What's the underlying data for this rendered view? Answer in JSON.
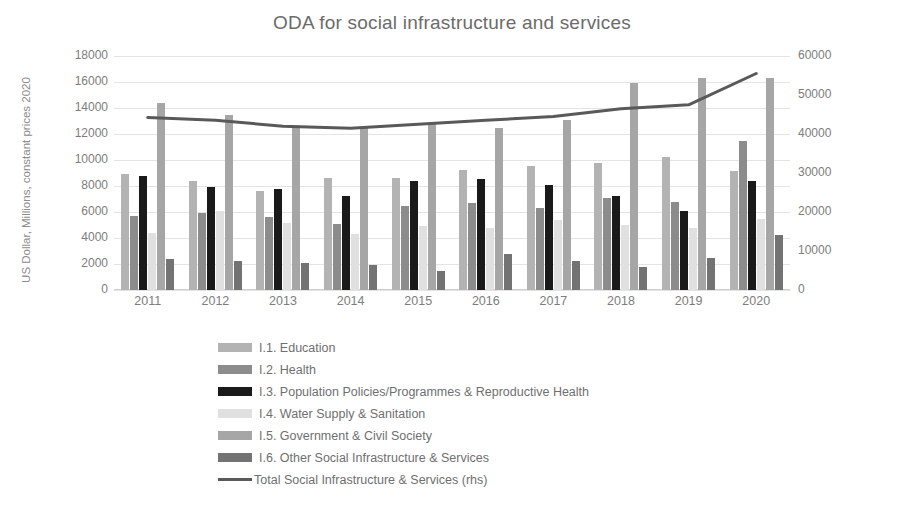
{
  "chart_data": {
    "type": "bar",
    "title": "ODA for social infrastructure and services",
    "xlabel": "",
    "ylabel": "US Dollar, Millions, constant prices 2020",
    "ylabel_right": "",
    "categories": [
      "2011",
      "2012",
      "2013",
      "2014",
      "2015",
      "2016",
      "2017",
      "2018",
      "2019",
      "2020"
    ],
    "ylim": [
      0,
      18000
    ],
    "yticks": [
      "0",
      "2000",
      "4000",
      "6000",
      "8000",
      "10000",
      "12000",
      "14000",
      "16000",
      "18000"
    ],
    "ylim_right": [
      0,
      60000
    ],
    "yticks_right": [
      "0",
      "10000",
      "20000",
      "30000",
      "40000",
      "50000",
      "60000"
    ],
    "grid": true,
    "legend_position": "bottom",
    "series": [
      {
        "name": "I.1. Education",
        "color": "#b3b3b3",
        "axis": "left",
        "values": [
          8900,
          8350,
          7650,
          8650,
          8600,
          9200,
          9550,
          9750,
          10250,
          9150
        ]
      },
      {
        "name": "I.2. Health",
        "color": "#8c8c8c",
        "axis": "left",
        "values": [
          5700,
          5950,
          5650,
          5100,
          6500,
          6700,
          6300,
          7100,
          6750,
          11500
        ]
      },
      {
        "name": "I.3. Population Policies/Programmes & Reproductive Health",
        "color": "#1a1a1a",
        "axis": "left",
        "values": [
          8750,
          7900,
          7800,
          7250,
          8350,
          8550,
          8100,
          7200,
          6050,
          8350
        ]
      },
      {
        "name": "I.4. Water Supply & Sanitation",
        "color": "#e0e0e0",
        "axis": "left",
        "values": [
          4350,
          6050,
          5150,
          4300,
          4900,
          4800,
          5400,
          5000,
          4750,
          5450
        ]
      },
      {
        "name": "I.5. Government & Civil Society",
        "color": "#a6a6a6",
        "axis": "left",
        "values": [
          14350,
          13500,
          12550,
          12500,
          12800,
          12500,
          13100,
          15950,
          16300,
          16300
        ]
      },
      {
        "name": "I.6. Other Social Infrastructure & Services",
        "color": "#737373",
        "axis": "left",
        "values": [
          2400,
          2200,
          2050,
          1900,
          1500,
          2750,
          2250,
          1800,
          2450,
          4200
        ]
      }
    ],
    "line_series": {
      "name": "Total Social Infrastructure & Services (rhs)",
      "color": "#595959",
      "axis": "right",
      "values": [
        44200,
        43500,
        42000,
        41500,
        42500,
        43500,
        44500,
        46500,
        47500,
        55500
      ]
    }
  }
}
